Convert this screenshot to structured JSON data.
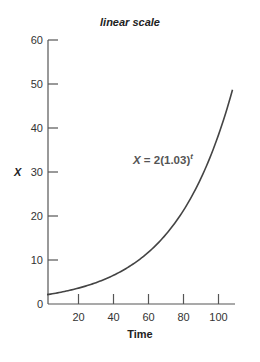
{
  "chart_data": {
    "type": "line",
    "title": "linear scale",
    "xlabel": "Time",
    "ylabel": "X",
    "xlim": [
      0,
      110
    ],
    "ylim": [
      0,
      60
    ],
    "x_ticks": [
      20,
      40,
      60,
      80,
      100
    ],
    "y_ticks": [
      0,
      10,
      20,
      30,
      40,
      50,
      60
    ],
    "grid": false,
    "legend": null,
    "annotations": [
      {
        "text": "X = 2(1.03)",
        "superscript": "t",
        "x": 60,
        "y": 33
      }
    ],
    "series": [
      {
        "name": "X = 2(1.03)^t",
        "formula": "2*1.03^t",
        "x": [
          2,
          10,
          20,
          30,
          40,
          50,
          60,
          70,
          80,
          90,
          100,
          108
        ],
        "values": [
          2.1,
          2.7,
          3.6,
          4.9,
          6.5,
          8.8,
          11.8,
          15.8,
          21.3,
          28.6,
          38.4,
          48.7
        ]
      }
    ],
    "colors": {
      "line": "#444444",
      "axis": "#555555"
    }
  }
}
